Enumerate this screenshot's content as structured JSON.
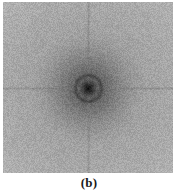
{
  "figure": {
    "caption": "(b)",
    "panel_label": "b",
    "image_kind": "fourier-magnitude-spectrum",
    "background_color": "#ffffff",
    "image_area": {
      "x": 3,
      "y": 2,
      "width": 170,
      "height": 171,
      "border": "none"
    }
  },
  "chart_data": {
    "type": "heatmap",
    "title": "",
    "subtitle": "",
    "xlabel": "",
    "ylabel": "",
    "colormap": "grayscale",
    "grid": false,
    "legend": false,
    "width": 170,
    "height": 171,
    "center": {
      "x": 85,
      "y": 86
    },
    "value_range": [
      0,
      255
    ],
    "background_level": 154,
    "corner_level": 178,
    "core_level": 12,
    "noise_amplitude": 26,
    "features": [
      {
        "name": "dc-core",
        "kind": "dark-blob",
        "cx": 85,
        "cy": 86,
        "radius": 6,
        "level": 14
      },
      {
        "name": "center-halo",
        "kind": "radial-gradient",
        "cx": 85,
        "cy": 86,
        "radius": 60,
        "inner_level": 70,
        "outer_level": 152
      },
      {
        "name": "dark-ring",
        "kind": "ring",
        "cx": 85,
        "cy": 86,
        "radius": 13,
        "thickness": 1.6,
        "level": 60
      },
      {
        "name": "horizontal-spike",
        "kind": "line",
        "orientation": "horizontal",
        "level": 118,
        "thickness": 1.5,
        "length": 170
      },
      {
        "name": "vertical-spike",
        "kind": "line",
        "orientation": "vertical",
        "level": 120,
        "thickness": 1.5,
        "length": 171
      },
      {
        "name": "vignette",
        "kind": "corner-brightening",
        "level": 182
      }
    ]
  }
}
